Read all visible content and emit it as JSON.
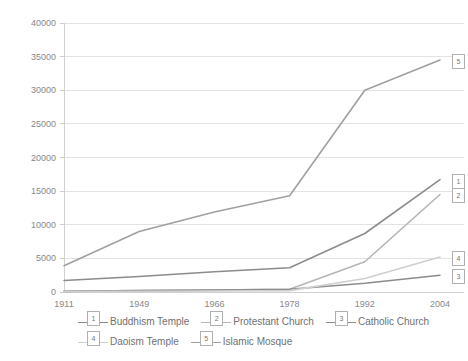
{
  "chart_data": {
    "type": "line",
    "title": "",
    "subtitle": "",
    "xlabel": "",
    "ylabel": "",
    "categories": [
      "1911",
      "1949",
      "1966",
      "1978",
      "1992",
      "2004"
    ],
    "ylim": [
      0,
      40000
    ],
    "ytick_labels": [
      "0",
      "5000",
      "10000",
      "15000",
      "20000",
      "25000",
      "30000",
      "35000",
      "40000"
    ],
    "ytick_values": [
      0,
      5000,
      10000,
      15000,
      20000,
      25000,
      30000,
      35000,
      40000
    ],
    "grid": true,
    "legend_position": "bottom",
    "series": [
      {
        "name": "Buddhism Temple",
        "marker_label": "1",
        "color": "#8c8c8c",
        "values": [
          1700,
          2300,
          3000,
          3600,
          8700,
          16700
        ]
      },
      {
        "name": "Protestant Church",
        "marker_label": "2",
        "color": "#b5b5b5",
        "values": [
          100,
          200,
          300,
          400,
          4500,
          14500
        ]
      },
      {
        "name": "Catholic Church",
        "marker_label": "3",
        "color": "#8c8c8c",
        "values": [
          100,
          200,
          300,
          400,
          1300,
          2500
        ]
      },
      {
        "name": "Daoism Temple",
        "marker_label": "4",
        "color": "#cfcfcf",
        "values": [
          50,
          100,
          150,
          200,
          2000,
          5200
        ]
      },
      {
        "name": "Islamic Mosque",
        "marker_label": "5",
        "color": "#a0a0a0",
        "values": [
          3900,
          9000,
          11900,
          14300,
          30000,
          34500
        ]
      }
    ]
  },
  "legend": {
    "rows": [
      [
        {
          "marker": "1",
          "label": "Buddhism Temple",
          "color": "#8c8c8c"
        },
        {
          "marker": "2",
          "label": "Protestant Church",
          "color": "#b5b5b5"
        },
        {
          "marker": "3",
          "label": "Catholic Church",
          "color": "#8c8c8c"
        }
      ],
      [
        {
          "marker": "4",
          "label": "Daoism Temple",
          "color": "#cfcfcf"
        },
        {
          "marker": "5",
          "label": "Islamic Mosque",
          "color": "#a0a0a0"
        }
      ]
    ]
  },
  "axis": {
    "grid_color": "#e3e3e3",
    "axis_color": "#d0d0d0",
    "tick_text_color": "#888888"
  }
}
